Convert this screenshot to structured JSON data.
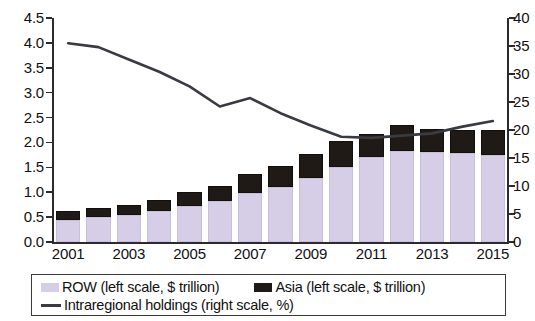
{
  "chart_data": {
    "type": "bar",
    "title": "",
    "subtitle": "",
    "xlabel": "",
    "ylabel": "",
    "ylabel_right": "",
    "grid": false,
    "legend_position": "bottom",
    "x": [
      2001,
      2002,
      2003,
      2004,
      2005,
      2006,
      2007,
      2008,
      2009,
      2010,
      2011,
      2012,
      2013,
      2014,
      2015
    ],
    "categories": [
      "2001",
      "2002",
      "2003",
      "2004",
      "2005",
      "2006",
      "2007",
      "2008",
      "2009",
      "2010",
      "2011",
      "2012",
      "2013",
      "2014",
      "2015"
    ],
    "x_tick_labels": [
      "2001",
      "2003",
      "2005",
      "2007",
      "2009",
      "2011",
      "2013",
      "2015"
    ],
    "y_tick_labels_left": [
      "0.0",
      "0.5",
      "1.0",
      "1.5",
      "2.0",
      "2.5",
      "3.0",
      "3.5",
      "4.0",
      "4.5"
    ],
    "y_tick_labels_right": [
      "0",
      "5",
      "10",
      "15",
      "20",
      "25",
      "30",
      "35",
      "40"
    ],
    "ylim": [
      0,
      4.5
    ],
    "ylim_right": [
      0,
      40
    ],
    "stacked": true,
    "series": [
      {
        "name": "ROW (left scale, $ trillion)",
        "axis": "left",
        "kind": "bar",
        "color": "#d6cde7",
        "values": [
          0.45,
          0.5,
          0.55,
          0.62,
          0.72,
          0.82,
          0.98,
          1.1,
          1.28,
          1.5,
          1.7,
          1.82,
          1.8,
          1.78,
          1.75
        ]
      },
      {
        "name": "Asia (left scale, $ trillion)",
        "axis": "left",
        "kind": "bar",
        "color": "#201a17",
        "values": [
          0.17,
          0.18,
          0.2,
          0.22,
          0.28,
          0.3,
          0.38,
          0.42,
          0.48,
          0.52,
          0.48,
          0.53,
          0.48,
          0.48,
          0.5
        ]
      },
      {
        "name": "Intraregional holdings (right scale, %)",
        "axis": "right",
        "kind": "line",
        "color": "#3a3a42",
        "values": [
          35.5,
          34.8,
          32.6,
          30.4,
          27.8,
          24.2,
          25.7,
          23.0,
          20.8,
          18.8,
          18.6,
          19.0,
          19.4,
          20.6,
          21.6
        ]
      }
    ],
    "bar_totals": [
      0.62,
      0.68,
      0.75,
      0.84,
      1.0,
      1.12,
      1.36,
      1.52,
      1.76,
      2.02,
      2.18,
      2.35,
      2.28,
      2.26,
      2.25
    ]
  },
  "legend": {
    "entries": [
      {
        "label": "ROW (left scale, $ trillion)",
        "swatch": "lavender-square",
        "color": "#d6cde7"
      },
      {
        "label": "Asia (left scale, $ trillion)",
        "swatch": "black-square",
        "color": "#201a17"
      },
      {
        "label": "Intraregional holdings (right scale, %)",
        "swatch": "line-segment",
        "color": "#3a3a42"
      }
    ]
  }
}
